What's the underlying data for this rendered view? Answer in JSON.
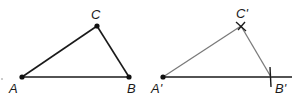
{
  "diagram": {
    "original_triangle": {
      "vertices": [
        {
          "id": "A",
          "label": "A",
          "x": 22,
          "y": 77,
          "lx": 10,
          "ly": 93
        },
        {
          "id": "B",
          "label": "B",
          "x": 129,
          "y": 77,
          "lx": 128,
          "ly": 93
        },
        {
          "id": "C",
          "label": "C",
          "x": 97,
          "y": 26,
          "lx": 91,
          "ly": 19
        }
      ],
      "stroke": "#1a1a1a"
    },
    "copy_triangle": {
      "vertices": [
        {
          "id": "A'",
          "label": "A'",
          "x": 163,
          "y": 77,
          "lx": 152,
          "ly": 93
        },
        {
          "id": "B'",
          "label": "B'",
          "x": 271,
          "y": 77,
          "lx": 275,
          "ly": 93
        },
        {
          "id": "C'",
          "label": "C'",
          "x": 241,
          "y": 26,
          "lx": 237,
          "ly": 18
        }
      ],
      "base_ray_end_x": 292,
      "stroke_base": "#1a1a1a",
      "stroke_sides": "#7a7a7a",
      "arc_marks": [
        "B'",
        "C'"
      ]
    },
    "labels": {
      "A": "A",
      "B": "B",
      "C": "C",
      "A_prime": "A'",
      "B_prime": "B'",
      "C_prime": "C'"
    }
  }
}
